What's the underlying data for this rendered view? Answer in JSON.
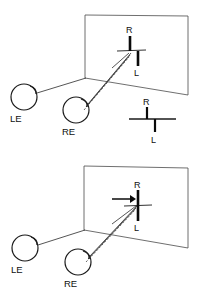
{
  "figure": {
    "background_color": "#ffffff",
    "ink_color": "#101010",
    "panels": [
      {
        "id": "top",
        "name": "uncrossed-disparity-panel",
        "description": "Left and right eye viewing a screen; R and L nonius bars appear horizontally offset",
        "eyes": [
          {
            "id": "LE",
            "label": "LE",
            "name": "left-eye",
            "cx": 24,
            "cy": 97,
            "r": 13
          },
          {
            "id": "RE",
            "label": "RE",
            "name": "right-eye",
            "cx": 76,
            "cy": 110,
            "r": 13
          }
        ],
        "screen": {
          "name": "projection-screen",
          "corners": "85,15 188,16 188,95 85,78"
        },
        "nonius": {
          "top_label": "R",
          "bottom_label": "L",
          "top_bar_x": 130,
          "bottom_bar_x": 138,
          "cross_y": 51
        },
        "rays": [
          {
            "name": "left-eye-sight-line",
            "style": "solid",
            "from": "LE",
            "to": "screen-bottom-left"
          },
          {
            "name": "right-eye-sight-line-upper",
            "style": "solid",
            "from": "RE",
            "to": "nonius"
          },
          {
            "name": "right-eye-sight-line-lower",
            "style": "solid",
            "from": "RE",
            "to": "nonius"
          },
          {
            "name": "right-eye-sight-line-dashed",
            "style": "dashed",
            "from": "RE",
            "to": "nonius"
          }
        ],
        "inset": {
          "name": "nonius-detail-inset",
          "top_label": "R",
          "bottom_label": "L",
          "description": "Enlarged view of the offset nonius lines"
        }
      },
      {
        "id": "bottom",
        "name": "fused-alignment-panel",
        "description": "Same configuration after alignment; an arrow indicates the R bar shifted into alignment with L",
        "eyes": [
          {
            "id": "LE",
            "label": "LE",
            "name": "left-eye",
            "cx": 25,
            "cy": 248,
            "r": 13
          },
          {
            "id": "RE",
            "label": "RE",
            "name": "right-eye",
            "cx": 78,
            "cy": 262,
            "r": 13
          }
        ],
        "screen": {
          "name": "projection-screen",
          "corners": "84,166 188,168 188,248 84,230"
        },
        "nonius": {
          "top_label": "R",
          "bottom_label": "L",
          "top_bar_x": 138,
          "bottom_bar_x": 138,
          "cross_y": 206
        },
        "arrow": {
          "name": "shift-arrow",
          "direction": "right",
          "x_start": 112,
          "x_end": 133,
          "y": 199
        },
        "rays": [
          {
            "name": "left-eye-sight-line",
            "style": "solid",
            "from": "LE",
            "to": "screen-bottom-left"
          },
          {
            "name": "right-eye-sight-line-upper",
            "style": "solid",
            "from": "RE",
            "to": "nonius"
          },
          {
            "name": "right-eye-sight-line-lower",
            "style": "solid",
            "from": "RE",
            "to": "nonius"
          },
          {
            "name": "right-eye-sight-line-dashed",
            "style": "dashed",
            "from": "RE",
            "to": "nonius"
          }
        ]
      }
    ],
    "labels": {
      "left_eye": "LE",
      "right_eye": "RE",
      "right_nonius": "R",
      "left_nonius": "L"
    }
  }
}
